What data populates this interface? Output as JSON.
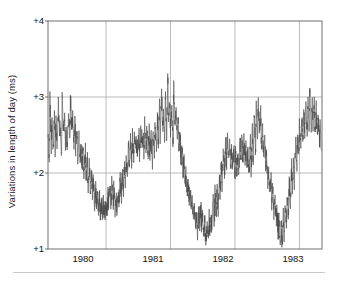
{
  "figure": {
    "kind": "line-plot",
    "background_color": "#ffffff",
    "axis_color": "#6e6e6e",
    "grid_color": "#a8a8a8",
    "line_color": "#4a4a4a",
    "text_color": "#111111"
  },
  "axis": {
    "y_label": "Variations in length of day (ms)",
    "y_ticks": [
      "+4",
      "+3",
      "+2",
      "+1"
    ],
    "x_ticks": [
      "1980",
      "1981",
      "1982",
      "1983"
    ]
  },
  "chart_data": {
    "type": "line",
    "title": "",
    "subtitle": "",
    "xlabel": "",
    "ylabel": "Variations in length of day (ms)",
    "xlim": [
      1979.6,
      1983.85
    ],
    "ylim": [
      1,
      4
    ],
    "ytick_values": [
      1,
      2,
      3,
      4
    ],
    "ytick_labels": [
      "+1",
      "+2",
      "+3",
      "+4"
    ],
    "xtick_values": [
      1980,
      1981,
      1982,
      1983
    ],
    "xtick_labels": [
      "1980",
      "1981",
      "1982",
      "1983"
    ],
    "grid": true,
    "grid_axes": "both",
    "legend": false,
    "legend_position": "none",
    "units": "ms",
    "series": [
      {
        "name": "Variations in length of day",
        "color": "#4a4a4a",
        "linewidth": 0.6,
        "x": [
          1979.6,
          1979.62,
          1979.63,
          1979.65,
          1979.66,
          1979.68,
          1979.7,
          1979.71,
          1979.73,
          1979.74,
          1979.76,
          1979.78,
          1979.79,
          1979.81,
          1979.82,
          1979.84,
          1979.86,
          1979.87,
          1979.89,
          1979.9,
          1979.92,
          1979.94,
          1979.95,
          1979.97,
          1979.98,
          1980.0,
          1980.02,
          1980.03,
          1980.05,
          1980.06,
          1980.08,
          1980.1,
          1980.11,
          1980.13,
          1980.14,
          1980.16,
          1980.18,
          1980.19,
          1980.21,
          1980.22,
          1980.24,
          1980.26,
          1980.27,
          1980.29,
          1980.3,
          1980.32,
          1980.34,
          1980.35,
          1980.37,
          1980.38,
          1980.4,
          1980.42,
          1980.43,
          1980.45,
          1980.46,
          1980.48,
          1980.5,
          1980.51,
          1980.53,
          1980.54,
          1980.56,
          1980.58,
          1980.59,
          1980.61,
          1980.62,
          1980.64,
          1980.66,
          1980.67,
          1980.69,
          1980.7,
          1980.72,
          1980.74,
          1980.75,
          1980.77,
          1980.78,
          1980.8,
          1980.82,
          1980.83,
          1980.85,
          1980.86,
          1980.88,
          1980.9,
          1980.91,
          1980.93,
          1980.94,
          1980.96,
          1980.98,
          1980.99,
          1981.01,
          1981.02,
          1981.04,
          1981.06,
          1981.07,
          1981.09,
          1981.1,
          1981.12,
          1981.14,
          1981.15,
          1981.17,
          1981.18,
          1981.2,
          1981.22,
          1981.23,
          1981.25,
          1981.26,
          1981.28,
          1981.3,
          1981.31,
          1981.33,
          1981.34,
          1981.36,
          1981.38,
          1981.39,
          1981.41,
          1981.42,
          1981.44,
          1981.46,
          1981.47,
          1981.49,
          1981.5,
          1981.52,
          1981.54,
          1981.55,
          1981.57,
          1981.58,
          1981.6,
          1981.62,
          1981.63,
          1981.65,
          1981.66,
          1981.68,
          1981.7,
          1981.71,
          1981.73,
          1981.74,
          1981.76,
          1981.78,
          1981.79,
          1981.81,
          1981.82,
          1981.84,
          1981.86,
          1981.87,
          1981.89,
          1981.9,
          1981.92,
          1981.94,
          1981.95,
          1981.97,
          1981.98,
          1982.0,
          1982.02,
          1982.03,
          1982.05,
          1982.06,
          1982.08,
          1982.1,
          1982.11,
          1982.13,
          1982.14,
          1982.16,
          1982.18,
          1982.19,
          1982.21,
          1982.22,
          1982.24,
          1982.26,
          1982.27,
          1982.29,
          1982.3,
          1982.32,
          1982.34,
          1982.35,
          1982.37,
          1982.38,
          1982.4,
          1982.42,
          1982.43,
          1982.45,
          1982.46,
          1982.48,
          1982.5,
          1982.51,
          1982.53,
          1982.54,
          1982.56,
          1982.58,
          1982.59,
          1982.61,
          1982.62,
          1982.64,
          1982.66,
          1982.67,
          1982.69,
          1982.7,
          1982.72,
          1982.74,
          1982.75,
          1982.77,
          1982.78,
          1982.8,
          1982.82,
          1982.83,
          1982.85,
          1982.86,
          1982.88,
          1982.9,
          1982.91,
          1982.93,
          1982.94,
          1982.96,
          1982.98,
          1982.99,
          1983.01,
          1983.02,
          1983.04,
          1983.06,
          1983.07,
          1983.09,
          1983.1,
          1983.12,
          1983.14,
          1983.15,
          1983.17,
          1983.18,
          1983.2,
          1983.22,
          1983.23,
          1983.25,
          1983.26,
          1983.28,
          1983.3,
          1983.31,
          1983.33,
          1983.34,
          1983.36,
          1983.38,
          1983.39,
          1983.41,
          1983.42,
          1983.44,
          1983.46,
          1983.47,
          1983.49,
          1983.5,
          1983.52,
          1983.54,
          1983.55,
          1983.57,
          1983.58,
          1983.6,
          1983.62,
          1983.63,
          1983.65,
          1983.66,
          1983.68,
          1983.7,
          1983.71,
          1983.73,
          1983.74,
          1983.76,
          1983.78,
          1983.79,
          1983.81,
          1983.82,
          1983.84
        ],
        "y": [
          2.55,
          2.18,
          2.95,
          2.4,
          2.62,
          2.25,
          2.88,
          2.35,
          2.7,
          2.3,
          2.92,
          2.45,
          2.66,
          2.2,
          3.02,
          2.5,
          2.72,
          2.35,
          2.6,
          2.28,
          2.82,
          2.42,
          3.05,
          2.58,
          2.74,
          2.38,
          2.64,
          2.3,
          2.55,
          2.22,
          2.48,
          2.12,
          2.4,
          2.05,
          2.32,
          1.98,
          2.26,
          1.92,
          2.18,
          1.86,
          2.1,
          1.78,
          2.0,
          1.7,
          1.92,
          1.62,
          1.82,
          1.55,
          1.74,
          1.5,
          1.68,
          1.45,
          1.62,
          1.42,
          1.58,
          1.48,
          1.66,
          1.52,
          1.72,
          1.56,
          1.8,
          1.6,
          1.86,
          1.55,
          1.78,
          1.5,
          1.7,
          1.58,
          1.82,
          1.64,
          1.9,
          1.7,
          1.98,
          1.8,
          2.1,
          1.9,
          2.22,
          2.0,
          2.32,
          2.1,
          2.4,
          2.18,
          2.48,
          2.26,
          2.54,
          2.3,
          2.44,
          2.2,
          2.52,
          2.28,
          2.6,
          2.34,
          2.56,
          2.3,
          2.62,
          2.36,
          2.58,
          2.28,
          2.5,
          2.22,
          2.46,
          2.18,
          2.55,
          2.25,
          2.64,
          2.32,
          2.72,
          2.4,
          2.88,
          2.45,
          3.1,
          2.58,
          2.8,
          2.42,
          3.02,
          2.52,
          3.3,
          2.7,
          2.95,
          2.55,
          2.8,
          2.4,
          3.18,
          2.62,
          2.9,
          2.48,
          2.7,
          2.35,
          2.52,
          2.2,
          2.34,
          2.0,
          2.18,
          1.88,
          2.02,
          1.75,
          1.88,
          1.65,
          1.74,
          1.55,
          1.62,
          1.42,
          1.5,
          1.3,
          1.42,
          1.22,
          1.48,
          1.28,
          1.55,
          1.35,
          1.45,
          1.18,
          1.38,
          1.05,
          1.3,
          1.12,
          1.4,
          1.2,
          1.5,
          1.28,
          1.58,
          1.35,
          1.7,
          1.45,
          1.85,
          1.55,
          2.0,
          1.7,
          2.15,
          1.85,
          2.3,
          1.98,
          2.42,
          2.1,
          2.48,
          2.18,
          2.4,
          2.12,
          2.36,
          2.05,
          2.3,
          2.0,
          2.26,
          1.96,
          2.34,
          2.05,
          2.42,
          2.12,
          2.5,
          2.2,
          2.44,
          2.15,
          2.38,
          2.08,
          2.34,
          2.02,
          2.42,
          2.1,
          2.55,
          2.2,
          2.7,
          2.32,
          2.85,
          2.45,
          3.05,
          2.55,
          2.8,
          2.4,
          2.62,
          2.25,
          2.45,
          2.05,
          2.28,
          1.88,
          2.1,
          1.72,
          1.95,
          1.6,
          1.8,
          1.48,
          1.68,
          1.36,
          1.55,
          1.22,
          1.45,
          1.12,
          1.35,
          1.05,
          1.42,
          1.18,
          1.55,
          1.3,
          1.7,
          1.45,
          1.88,
          1.6,
          2.05,
          1.78,
          2.22,
          1.92,
          2.38,
          2.08,
          2.52,
          2.22,
          2.64,
          2.32,
          2.74,
          2.4,
          2.82,
          2.46,
          2.9,
          2.52,
          2.96,
          2.58,
          3.02,
          2.62,
          2.95,
          2.55,
          2.88,
          2.5,
          2.8,
          2.45,
          2.72,
          2.38,
          2.65,
          2.3
        ]
      }
    ],
    "annotations": []
  }
}
